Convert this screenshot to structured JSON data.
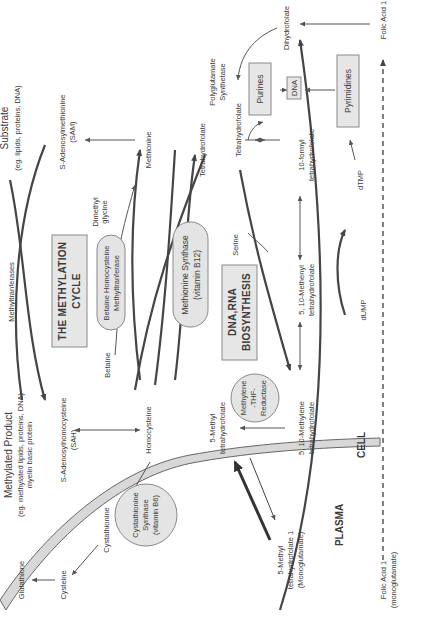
{
  "diagram": {
    "orientation": "rotated 90° counter-clockwise",
    "regions": {
      "plasma": "PLASMA",
      "cell": "CELL"
    },
    "boxes": {
      "methylation_cycle_line1": "THE METHYLATION",
      "methylation_cycle_line2": "CYCLE",
      "dna_rna_line1": "DNA,RNA",
      "dna_rna_line2": "BIOSYNTHESIS",
      "purines": "Purines",
      "pyrimidines": "Pyrimidines",
      "dna": "DNA"
    },
    "enzymes": {
      "bhmt_line1": "Betaine Homocysteine",
      "bhmt_line2": "Methyltranferase",
      "ms_line1": "Methionine Synthase",
      "ms_line2": "(vitamin B12)",
      "mthfr_line1": "Methylene",
      "mthfr_line2": "-THF-",
      "mthfr_line3": "Reductase",
      "cbs_line1": "Cystathionine",
      "cbs_line2": "Synthase",
      "cbs_line3": "(vitamin B6)"
    },
    "labels": {
      "substrate_title": "Substrate",
      "substrate_sub": "(eg. lipids, proteins, DNA)",
      "sam_line1": "S-Adenosylmethionine",
      "sam_line2": "(SAM)",
      "methionine": "Methionine",
      "tetrahydrofolate_top": "Tetrahydrofolate",
      "polyglutamate_line1": "Polyglutamate",
      "polyglutamate_line2": "Synthetase",
      "tetrahydrofolate_mid": "Tetrahydrofolate",
      "dihydrofolate": "Dihydrofolate",
      "folic_acid_top": "Folic Acid 1",
      "dimethyl_line1": "Dimethyl",
      "dimethyl_line2": "glycine",
      "methyltransferases": "Methyltranferases",
      "betaine": "Betaine",
      "serine": "Serine",
      "formyl_line1": "10-formyl",
      "formyl_line2": "tetrahydrofolate",
      "methenyl_line1": "5, 10-Methenyl",
      "methenyl_line2": "tetrahydrofolate",
      "dtmp": "dTMP",
      "dump": "dUMP",
      "methylated_title": "Methylated Product",
      "methylated_sub1": "(eg. methylated lipids, proteins, DNA)",
      "methylated_sub2": "myelin basic protein",
      "sah_line1": "S-Adenosylhomocysteine",
      "sah_line2": "(SAH)",
      "homocysteine": "Homocysteine",
      "methyl_thf_line1": "5-Methyl",
      "methyl_thf_line2": "tetrahydrofolate",
      "methylene_line1": "5, 10-Methylene",
      "methylene_line2": "tetrahydrofolate",
      "cystathionine": "Cystathionine",
      "glutathione": "Glutathione",
      "cysteine": "Cysteine",
      "plasma_mthf_line1": "5-Methyl",
      "plasma_mthf_line2": "tetrahydrofolate 1",
      "plasma_mthf_line3": "(Monoglutamate)",
      "folic_plasma_line1": "Folic Acid 1",
      "folic_plasma_line2": "(monoglutamate)"
    },
    "colors": {
      "box_fill": "#e6e6e6",
      "stroke": "#454545",
      "membrane_fill": "#d8d8d8",
      "text": "#3a3a3a"
    }
  }
}
